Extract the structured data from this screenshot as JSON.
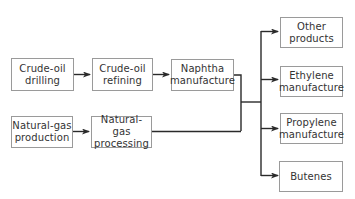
{
  "diagram": {
    "type": "flowchart",
    "colors": {
      "line": "#2a2a2a",
      "box_border": "#9a9a9a",
      "text": "#333333"
    },
    "nodes": [
      {
        "id": "crude_drilling",
        "line1": "Crude-oil",
        "line2": "drilling"
      },
      {
        "id": "crude_refining",
        "line1": "Crude-oil",
        "line2": "refining"
      },
      {
        "id": "naphtha",
        "line1": "Naphtha",
        "line2": "manufacture"
      },
      {
        "id": "ng_production",
        "line1": "Natural-gas",
        "line2": "production"
      },
      {
        "id": "ng_processing",
        "line1": "Natural-gas",
        "line2": "processing"
      },
      {
        "id": "other",
        "line1": "Other",
        "line2": "products"
      },
      {
        "id": "ethylene",
        "line1": "Ethylene",
        "line2": "manufacture"
      },
      {
        "id": "propylene",
        "line1": "Propylene",
        "line2": "manufacture"
      },
      {
        "id": "butenes",
        "line1": "Butenes",
        "line2": ""
      }
    ],
    "edges": [
      {
        "from": "crude_drilling",
        "to": "crude_refining"
      },
      {
        "from": "crude_refining",
        "to": "naphtha"
      },
      {
        "from": "ng_production",
        "to": "ng_processing"
      },
      {
        "from": "naphtha",
        "to": "other"
      },
      {
        "from": "naphtha",
        "to": "ethylene"
      },
      {
        "from": "naphtha",
        "to": "propylene"
      },
      {
        "from": "naphtha",
        "to": "butenes"
      },
      {
        "from": "ng_processing",
        "to": "other"
      },
      {
        "from": "ng_processing",
        "to": "ethylene"
      },
      {
        "from": "ng_processing",
        "to": "propylene"
      },
      {
        "from": "ng_processing",
        "to": "butenes"
      }
    ]
  }
}
